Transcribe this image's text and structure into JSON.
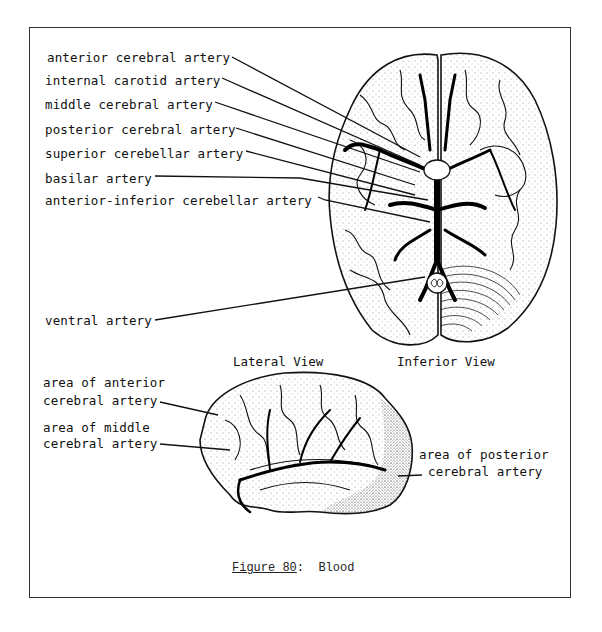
{
  "figure": {
    "caption_label": "Figure 80",
    "caption_sep": ":  ",
    "caption_title": "Blood"
  },
  "inferior_view": {
    "title": "Inferior View",
    "labels": [
      "anterior cerebral artery",
      "internal carotid artery",
      "middle cerebral artery",
      "posterior cerebral artery",
      "superior cerebellar artery",
      "basilar artery",
      "anterior-inferior cerebellar artery",
      "ventral artery"
    ]
  },
  "lateral_view": {
    "title": "Lateral View",
    "labels": [
      {
        "line1": "area of anterior",
        "line2": "cerebral artery"
      },
      {
        "line1": "area of middle",
        "line2": "cerebral artery"
      },
      {
        "line1": "area of posterior",
        "line2": "cerebral artery"
      }
    ]
  },
  "colors": {
    "ink": "#111111",
    "frame": "#333333",
    "paper": "#ffffff"
  }
}
